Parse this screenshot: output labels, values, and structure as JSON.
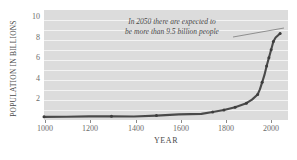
{
  "chart_data": {
    "type": "line",
    "title": "",
    "xlabel": "YEAR",
    "ylabel": "POPULATION IN BILLIONS",
    "xlim": [
      1000,
      2085
    ],
    "ylim": [
      0,
      10.8
    ],
    "xticks": [
      "1000",
      "1200",
      "1400",
      "1600",
      "1800",
      "2000"
    ],
    "xtick_values": [
      1000,
      1200,
      1400,
      1600,
      1800,
      2000
    ],
    "yticks": [
      "2",
      "4",
      "6",
      "8",
      "10"
    ],
    "ytick_values": [
      2,
      4,
      6,
      8,
      10
    ],
    "grid": "horizontal",
    "legend": "none",
    "series": [
      {
        "name": "World population",
        "x": [
          1000,
          1100,
          1200,
          1300,
          1400,
          1500,
          1600,
          1700,
          1750,
          1800,
          1850,
          1900,
          1925,
          1950,
          1960,
          1970,
          1980,
          1990,
          2000,
          2010,
          2020,
          2030,
          2040,
          2050
        ],
        "values": [
          0.31,
          0.32,
          0.36,
          0.36,
          0.35,
          0.43,
          0.55,
          0.6,
          0.79,
          0.98,
          1.26,
          1.65,
          2.0,
          2.5,
          3.0,
          3.7,
          4.4,
          5.3,
          6.1,
          6.9,
          7.7,
          8.1,
          8.3,
          8.5
        ]
      }
    ],
    "markers": [
      {
        "x": 1000,
        "y": 0.31
      },
      {
        "x": 1300,
        "y": 0.36
      },
      {
        "x": 1500,
        "y": 0.43
      },
      {
        "x": 1750,
        "y": 0.79
      },
      {
        "x": 1800,
        "y": 0.98
      },
      {
        "x": 1850,
        "y": 1.26
      },
      {
        "x": 1900,
        "y": 1.65
      },
      {
        "x": 1950,
        "y": 2.5
      },
      {
        "x": 1970,
        "y": 3.7
      },
      {
        "x": 1990,
        "y": 5.3
      },
      {
        "x": 2000,
        "y": 6.1
      },
      {
        "x": 2010,
        "y": 6.9
      },
      {
        "x": 2020,
        "y": 7.7
      },
      {
        "x": 2050,
        "y": 8.5
      }
    ],
    "annotations": [
      {
        "name": "population-2050-note",
        "line1": "In 2050 there are expected to",
        "line2": "be more than 9.5 billion people",
        "leader_from": [
          233,
          37
        ],
        "leader_to": [
          284,
          28
        ]
      }
    ],
    "colors": {
      "plot_background": "#dcdcdc",
      "gridline": "#f3f3f3",
      "line": "#4a4a4a",
      "text": "#4a4a4a",
      "tick_text": "#6b6b6b",
      "page_background": "#ffffff"
    }
  }
}
